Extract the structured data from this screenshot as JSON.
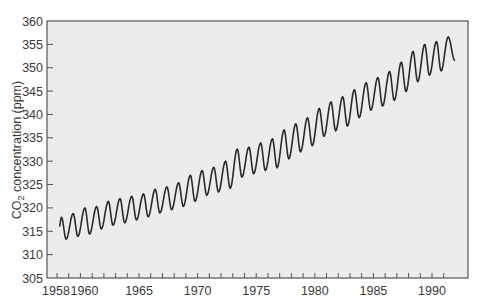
{
  "chart_data": {
    "type": "line",
    "title": "",
    "xlabel": "",
    "ylabel": "CO2 concentration (ppm)",
    "ylabel_parts": {
      "prefix": "CO",
      "subscript": "2",
      "suffix": " concentration (ppm)"
    },
    "xlim": [
      1957.2,
      1993.2
    ],
    "ylim": [
      305,
      360
    ],
    "y_ticks": [
      305,
      310,
      315,
      320,
      325,
      330,
      335,
      340,
      345,
      350,
      355,
      360
    ],
    "x_tick_labels": [
      {
        "year": 1958,
        "label": "1958"
      },
      {
        "year": 1960,
        "label": "1960"
      },
      {
        "year": 1965,
        "label": "1965"
      },
      {
        "year": 1970,
        "label": "1970"
      },
      {
        "year": 1975,
        "label": "1975"
      },
      {
        "year": 1980,
        "label": "1980"
      },
      {
        "year": 1985,
        "label": "1985"
      },
      {
        "year": 1990,
        "label": "1990"
      }
    ],
    "x_minor_ticks_every_year": true,
    "grid": false,
    "background": "#ececec",
    "line_color": "#2a2a2a",
    "series": [
      {
        "name": "Monthly CO2 (Mauna Loa)",
        "description": "Seasonal oscillation: peak each ~May, trough each ~Oct",
        "annual_extremes": [
          {
            "year": 1958,
            "peak": 318.0,
            "trough": 313.3
          },
          {
            "year": 1959,
            "peak": 318.8,
            "trough": 313.9
          },
          {
            "year": 1960,
            "peak": 320.0,
            "trough": 314.4
          },
          {
            "year": 1961,
            "peak": 320.3,
            "trough": 315.5
          },
          {
            "year": 1962,
            "peak": 321.4,
            "trough": 316.3
          },
          {
            "year": 1963,
            "peak": 322.0,
            "trough": 316.8
          },
          {
            "year": 1964,
            "peak": 322.5,
            "trough": 317.4
          },
          {
            "year": 1965,
            "peak": 323.0,
            "trough": 318.1
          },
          {
            "year": 1966,
            "peak": 324.0,
            "trough": 318.9
          },
          {
            "year": 1967,
            "peak": 324.5,
            "trough": 319.6
          },
          {
            "year": 1968,
            "peak": 325.4,
            "trough": 320.3
          },
          {
            "year": 1969,
            "peak": 327.0,
            "trough": 321.4
          },
          {
            "year": 1970,
            "peak": 328.0,
            "trough": 322.7
          },
          {
            "year": 1971,
            "peak": 328.7,
            "trough": 323.4
          },
          {
            "year": 1972,
            "peak": 330.0,
            "trough": 324.2
          },
          {
            "year": 1973,
            "peak": 332.6,
            "trough": 326.6
          },
          {
            "year": 1974,
            "peak": 333.0,
            "trough": 327.3
          },
          {
            "year": 1975,
            "peak": 333.9,
            "trough": 328.0
          },
          {
            "year": 1976,
            "peak": 334.8,
            "trough": 328.6
          },
          {
            "year": 1977,
            "peak": 336.7,
            "trough": 330.5
          },
          {
            "year": 1978,
            "peak": 338.0,
            "trough": 332.0
          },
          {
            "year": 1979,
            "peak": 339.3,
            "trough": 333.3
          },
          {
            "year": 1980,
            "peak": 341.3,
            "trough": 335.3
          },
          {
            "year": 1981,
            "peak": 342.7,
            "trough": 336.5
          },
          {
            "year": 1982,
            "peak": 343.8,
            "trough": 337.5
          },
          {
            "year": 1983,
            "peak": 345.3,
            "trough": 339.3
          },
          {
            "year": 1984,
            "peak": 346.8,
            "trough": 340.9
          },
          {
            "year": 1985,
            "peak": 347.9,
            "trough": 341.8
          },
          {
            "year": 1986,
            "peak": 349.2,
            "trough": 343.0
          },
          {
            "year": 1987,
            "peak": 351.2,
            "trough": 344.9
          },
          {
            "year": 1988,
            "peak": 353.5,
            "trough": 347.0
          },
          {
            "year": 1989,
            "peak": 355.0,
            "trough": 348.4
          },
          {
            "year": 1990,
            "peak": 355.6,
            "trough": 349.3
          },
          {
            "year": 1991,
            "peak": 356.6,
            "trough": 351.5
          }
        ],
        "start": {
          "x": 1958.2,
          "y": 316.0
        },
        "end": {
          "x": 1991.95,
          "y": 351.5
        }
      }
    ]
  }
}
